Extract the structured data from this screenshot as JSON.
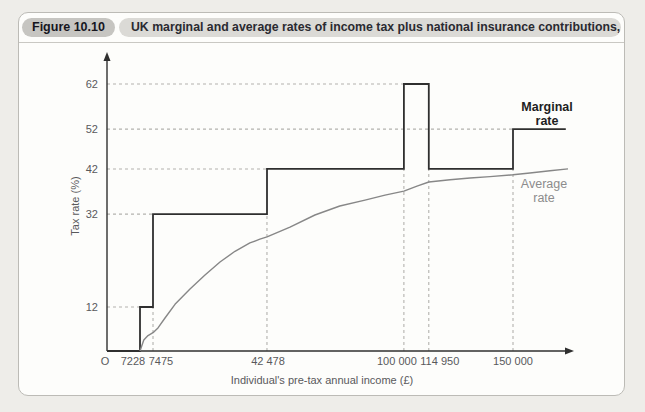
{
  "figure": {
    "badge": "Figure 10.10",
    "title": "UK marginal and average rates of income tax plus national insurance contributions, 2011/12"
  },
  "chart_data": {
    "type": "line",
    "title": "UK marginal and average rates of income tax plus national insurance contributions, 2011/12",
    "xlabel": "Individual's pre-tax annual income (£)",
    "ylabel": "Tax rate (%)",
    "x_axis_note": "schematic, not to scale",
    "y_ticks": [
      {
        "v": 12,
        "label": "12"
      },
      {
        "v": 32,
        "label": "32"
      },
      {
        "v": 42,
        "label": "42"
      },
      {
        "v": 52,
        "label": "52"
      },
      {
        "v": 62,
        "label": "62"
      }
    ],
    "x_ticks": [
      {
        "v": 0,
        "label": "O",
        "dx": -2
      },
      {
        "v": 7228,
        "label": "7228",
        "dx": -7
      },
      {
        "v": 7475,
        "label": "7475",
        "dx": 8
      },
      {
        "v": 42478,
        "label": "42 478",
        "dx": 1
      },
      {
        "v": 100000,
        "label": "100 000",
        "dx": -7
      },
      {
        "v": 114950,
        "label": "114 950",
        "dx": 11
      },
      {
        "v": 150000,
        "label": "150 000",
        "dx": 0
      }
    ],
    "series": [
      {
        "name": "Marginal rate",
        "style": "step",
        "color": "#2f2f2f",
        "width": 1.8,
        "points": [
          [
            0,
            0
          ],
          [
            7228,
            0
          ],
          [
            7228,
            12
          ],
          [
            7475,
            12
          ],
          [
            7475,
            32
          ],
          [
            42478,
            32
          ],
          [
            42478,
            42
          ],
          [
            100000,
            42
          ],
          [
            100000,
            62
          ],
          [
            114950,
            62
          ],
          [
            114950,
            42
          ],
          [
            150000,
            42
          ],
          [
            150000,
            52
          ],
          [
            174000,
            52
          ]
        ]
      },
      {
        "name": "Average rate",
        "style": "curve",
        "color": "#878787",
        "width": 1.4,
        "points": [
          [
            7228,
            0
          ],
          [
            7300,
            3
          ],
          [
            7380,
            4.2
          ],
          [
            7475,
            5
          ],
          [
            9000,
            6.3
          ],
          [
            11150,
            9
          ],
          [
            14230,
            12.6
          ],
          [
            18840,
            15.9
          ],
          [
            23450,
            18.9
          ],
          [
            28040,
            21.7
          ],
          [
            32660,
            24
          ],
          [
            37240,
            25.8
          ],
          [
            40300,
            26.6
          ],
          [
            42478,
            27.1
          ],
          [
            52160,
            29.2
          ],
          [
            62620,
            31.8
          ],
          [
            73080,
            33.8
          ],
          [
            83670,
            35.1
          ],
          [
            92070,
            36.2
          ],
          [
            100000,
            37.1
          ],
          [
            107860,
            38.2
          ],
          [
            114950,
            39.1
          ],
          [
            123770,
            39.6
          ],
          [
            132100,
            40
          ],
          [
            140420,
            40.3
          ],
          [
            150000,
            40.7
          ],
          [
            157700,
            41.1
          ],
          [
            166800,
            41.6
          ],
          [
            175000,
            42
          ]
        ]
      }
    ],
    "guides": {
      "horizontal": [
        {
          "y": 12,
          "x_to": 7228
        },
        {
          "y": 32,
          "x_to": 7475
        },
        {
          "y": 42,
          "x_to": 42478
        },
        {
          "y": 52,
          "x_to": 150000
        },
        {
          "y": 62,
          "x_to": 100000
        }
      ],
      "vertical": [
        {
          "x": 7475,
          "y_to": 12
        },
        {
          "x": 42478,
          "y_to": 32
        },
        {
          "x": 100000,
          "y_to": 42
        },
        {
          "x": 114950,
          "y_to": 42
        },
        {
          "x": 150000,
          "y_to": 42
        }
      ]
    },
    "annotations": [
      {
        "lines": [
          "Marginal",
          "rate"
        ],
        "x": 547,
        "y": 111,
        "color": "#1e1e22",
        "bold": true
      },
      {
        "lines": [
          "Average",
          "rate"
        ],
        "x": 544,
        "y": 188,
        "color": "#8c8c8c",
        "bold": false
      }
    ],
    "axis_hints": {
      "x_anchors": [
        [
          0,
          0
        ],
        [
          7228,
          0.0716
        ],
        [
          7475,
          0.0998
        ],
        [
          42478,
          0.347
        ],
        [
          100000,
          0.644
        ],
        [
          114950,
          0.698
        ],
        [
          150000,
          0.8807
        ],
        [
          175000,
          1
        ]
      ],
      "y_anchors": [
        [
          0,
          0
        ],
        [
          12,
          0.148
        ],
        [
          32,
          0.461
        ],
        [
          42,
          0.613
        ],
        [
          52,
          0.747
        ],
        [
          62,
          0.899
        ]
      ],
      "xlim": [
        0,
        175000
      ],
      "ylim": [
        0,
        68
      ],
      "grid": "dashed-guides-only",
      "legend_position": "inline-right"
    },
    "colors": {
      "marginal": "#2f2f2f",
      "average": "#878787",
      "guide": "#b3b2ae",
      "axis": "#2f2f2f",
      "tick_text": "#59595b"
    }
  }
}
